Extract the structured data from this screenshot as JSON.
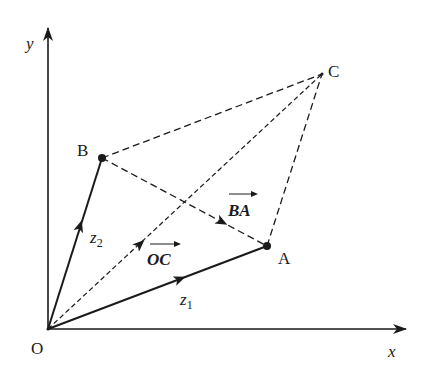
{
  "diagram": {
    "type": "complex-number vector parallelogram",
    "colors": {
      "ink": "#1a1a1a",
      "background": "#ffffff"
    },
    "axes": {
      "x_label": "x",
      "y_label": "y",
      "origin_label": "O"
    },
    "points": {
      "O": {
        "label": "O"
      },
      "A": {
        "label": "A"
      },
      "B": {
        "label": "B"
      },
      "C": {
        "label": "C"
      }
    },
    "vectors": {
      "z1": {
        "label": "z",
        "subscript": "1",
        "from": "O",
        "to": "A",
        "style": "solid"
      },
      "z2": {
        "label": "z",
        "subscript": "2",
        "from": "O",
        "to": "B",
        "style": "solid"
      },
      "OC": {
        "label": "OC",
        "from": "O",
        "to": "C",
        "style": "dashed"
      },
      "BA": {
        "label": "BA",
        "from": "B",
        "to": "A",
        "style": "dashed"
      }
    },
    "edges": [
      {
        "from": "B",
        "to": "C",
        "style": "dashed"
      },
      {
        "from": "A",
        "to": "C",
        "style": "dashed"
      }
    ]
  }
}
